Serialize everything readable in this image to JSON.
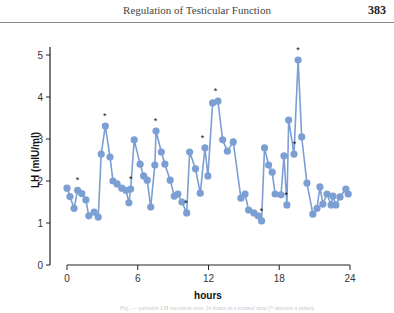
{
  "page": {
    "running_title": "Regulation of Testicular Function",
    "page_number": "383"
  },
  "chart_data": {
    "type": "line",
    "title": "",
    "xlabel": "hours",
    "ylabel": "LH (mIU/ml)",
    "xlim": [
      0,
      24
    ],
    "ylim": [
      0,
      5
    ],
    "x_ticks": [
      0,
      6,
      12,
      18,
      24
    ],
    "y_ticks": [
      0,
      1,
      2,
      3,
      4,
      5
    ],
    "grid": false,
    "legend": null,
    "series_color": "#7b9fd3",
    "annotation_symbol": "*",
    "annotations_at_hours": [
      0.9,
      3.2,
      5.4,
      7.5,
      10.1,
      11.5,
      12.6,
      16.5,
      18.6,
      19.3,
      19.6
    ],
    "x": [
      0.0,
      0.25,
      0.6,
      0.9,
      1.25,
      1.6,
      1.85,
      2.3,
      2.65,
      2.9,
      3.25,
      3.65,
      3.9,
      4.25,
      4.65,
      5.0,
      5.25,
      5.4,
      5.7,
      6.2,
      6.5,
      6.8,
      7.1,
      7.45,
      7.55,
      8.0,
      8.3,
      8.75,
      9.1,
      9.4,
      9.75,
      10.15,
      10.4,
      10.9,
      11.3,
      11.7,
      11.95,
      12.35,
      12.8,
      13.2,
      13.6,
      14.1,
      14.75,
      15.1,
      15.4,
      15.85,
      16.2,
      16.5,
      16.75,
      17.1,
      17.4,
      17.65,
      18.15,
      18.4,
      18.65,
      18.8,
      19.25,
      19.6,
      19.9,
      20.35,
      20.85,
      21.2,
      21.45,
      21.7,
      22.05,
      22.4,
      22.55,
      22.8,
      23.15,
      23.65,
      23.85
    ],
    "values": [
      1.83,
      1.63,
      1.35,
      1.78,
      1.7,
      1.55,
      1.17,
      1.26,
      1.14,
      2.64,
      3.31,
      2.57,
      2.0,
      1.93,
      1.83,
      1.78,
      1.48,
      1.81,
      2.98,
      2.4,
      2.12,
      2.02,
      1.38,
      2.38,
      3.19,
      2.69,
      2.4,
      2.02,
      1.64,
      1.69,
      1.5,
      1.24,
      2.69,
      2.29,
      1.71,
      2.79,
      2.12,
      3.86,
      3.9,
      2.98,
      2.71,
      2.93,
      1.59,
      1.69,
      1.31,
      1.24,
      1.17,
      1.05,
      2.79,
      2.38,
      2.21,
      1.69,
      1.67,
      2.6,
      1.43,
      3.45,
      2.64,
      4.88,
      3.05,
      1.95,
      1.21,
      1.35,
      1.86,
      1.45,
      1.69,
      1.43,
      1.64,
      1.43,
      1.62,
      1.81,
      1.69
    ]
  },
  "caption": "Fig. — pulsatile LH secretion over 24 hours in a normal man (* denotes a pulse)."
}
